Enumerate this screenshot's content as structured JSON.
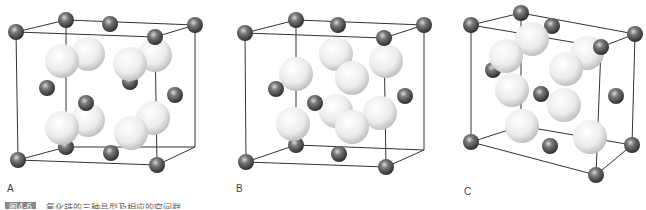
{
  "figure": {
    "caption_badge": "图4-6",
    "caption_text": "氟化锆的三种晶型及相应的空间群",
    "panels": [
      {
        "label": "A",
        "label_x": 7,
        "label_y": 186
      },
      {
        "label": "B",
        "label_x": 236,
        "label_y": 186
      },
      {
        "label": "C",
        "label_x": 464,
        "label_y": 189
      }
    ]
  },
  "colors": {
    "small_atom": "#5a5a5a",
    "large_atom": "#e6e6e6",
    "edge": "#333333"
  }
}
